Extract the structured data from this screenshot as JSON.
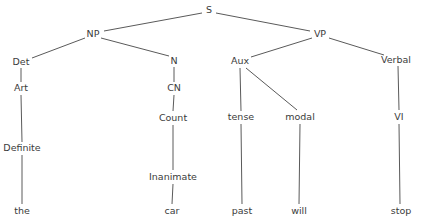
{
  "figure": {
    "type": "syntax-tree",
    "width": 423,
    "height": 223,
    "background_color": "#ffffff",
    "line_color": "#5a5a5a",
    "text_color": "#3b3b3b",
    "sentence_terminals": [
      "the",
      "car",
      "past",
      "will",
      "stop"
    ]
  },
  "nodes": [
    {
      "id": "S",
      "label": "S",
      "x": 209,
      "y": 10,
      "kind": "nonterminal"
    },
    {
      "id": "NP",
      "label": "NP",
      "x": 93,
      "y": 34,
      "kind": "nonterminal"
    },
    {
      "id": "VP",
      "label": "VP",
      "x": 320,
      "y": 34,
      "kind": "nonterminal"
    },
    {
      "id": "Det",
      "label": "Det",
      "x": 21,
      "y": 62,
      "kind": "nonterminal"
    },
    {
      "id": "N",
      "label": "N",
      "x": 174,
      "y": 61,
      "kind": "nonterminal"
    },
    {
      "id": "Aux",
      "label": "Aux",
      "x": 240,
      "y": 61,
      "kind": "nonterminal"
    },
    {
      "id": "Verbal",
      "label": "Verbal",
      "x": 396,
      "y": 60,
      "kind": "nonterminal"
    },
    {
      "id": "Art",
      "label": "Art",
      "x": 21,
      "y": 88,
      "kind": "nonterminal"
    },
    {
      "id": "CN",
      "label": "CN",
      "x": 174,
      "y": 88,
      "kind": "nonterminal"
    },
    {
      "id": "Count",
      "label": "Count",
      "x": 173,
      "y": 118,
      "kind": "nonterminal"
    },
    {
      "id": "tense",
      "label": "tense",
      "x": 241,
      "y": 117,
      "kind": "nonterminal"
    },
    {
      "id": "modal",
      "label": "modal",
      "x": 300,
      "y": 117,
      "kind": "nonterminal"
    },
    {
      "id": "VI",
      "label": "VI",
      "x": 399,
      "y": 117,
      "kind": "nonterminal"
    },
    {
      "id": "Definite",
      "label": "Definite",
      "x": 22,
      "y": 148,
      "kind": "nonterminal"
    },
    {
      "id": "Inanimate",
      "label": "Inanimate",
      "x": 173,
      "y": 177,
      "kind": "nonterminal"
    },
    {
      "id": "the",
      "label": "the",
      "x": 22,
      "y": 211,
      "kind": "terminal"
    },
    {
      "id": "car",
      "label": "car",
      "x": 172,
      "y": 211,
      "kind": "terminal"
    },
    {
      "id": "past",
      "label": "past",
      "x": 242,
      "y": 211,
      "kind": "terminal"
    },
    {
      "id": "will",
      "label": "will",
      "x": 299,
      "y": 211,
      "kind": "terminal"
    },
    {
      "id": "stop",
      "label": "stop",
      "x": 401,
      "y": 211,
      "kind": "terminal"
    }
  ],
  "edges": [
    {
      "from": "S",
      "to": "NP",
      "x1": 202,
      "y1": 13,
      "x2": 104,
      "y2": 31
    },
    {
      "from": "S",
      "to": "VP",
      "x1": 216,
      "y1": 13,
      "x2": 310,
      "y2": 31
    },
    {
      "from": "NP",
      "to": "Det",
      "x1": 85,
      "y1": 38,
      "x2": 32,
      "y2": 58
    },
    {
      "from": "NP",
      "to": "N",
      "x1": 101,
      "y1": 38,
      "x2": 169,
      "y2": 56
    },
    {
      "from": "VP",
      "to": "Aux",
      "x1": 312,
      "y1": 38,
      "x2": 251,
      "y2": 57
    },
    {
      "from": "VP",
      "to": "Verbal",
      "x1": 329,
      "y1": 38,
      "x2": 384,
      "y2": 55
    },
    {
      "from": "Det",
      "to": "Art",
      "x1": 21,
      "y1": 68,
      "x2": 21,
      "y2": 82
    },
    {
      "from": "N",
      "to": "CN",
      "x1": 174,
      "y1": 67,
      "x2": 174,
      "y2": 82
    },
    {
      "from": "Aux",
      "to": "tense",
      "x1": 240,
      "y1": 68,
      "x2": 241,
      "y2": 111
    },
    {
      "from": "Aux",
      "to": "modal",
      "x1": 246,
      "y1": 68,
      "x2": 297,
      "y2": 110
    },
    {
      "from": "Verbal",
      "to": "VI",
      "x1": 398,
      "y1": 66,
      "x2": 399,
      "y2": 110
    },
    {
      "from": "Art",
      "to": "Definite",
      "x1": 21,
      "y1": 95,
      "x2": 22,
      "y2": 142
    },
    {
      "from": "CN",
      "to": "Count",
      "x1": 174,
      "y1": 95,
      "x2": 173,
      "y2": 111
    },
    {
      "from": "Count",
      "to": "Inanimate",
      "x1": 173,
      "y1": 125,
      "x2": 173,
      "y2": 170
    },
    {
      "from": "tense",
      "to": "past",
      "x1": 241,
      "y1": 124,
      "x2": 242,
      "y2": 204
    },
    {
      "from": "modal",
      "to": "will",
      "x1": 300,
      "y1": 124,
      "x2": 299,
      "y2": 204
    },
    {
      "from": "VI",
      "to": "stop",
      "x1": 399,
      "y1": 124,
      "x2": 400,
      "y2": 204
    },
    {
      "from": "Definite",
      "to": "the",
      "x1": 22,
      "y1": 155,
      "x2": 22,
      "y2": 204
    },
    {
      "from": "Inanimate",
      "to": "car",
      "x1": 173,
      "y1": 184,
      "x2": 172,
      "y2": 204
    }
  ]
}
